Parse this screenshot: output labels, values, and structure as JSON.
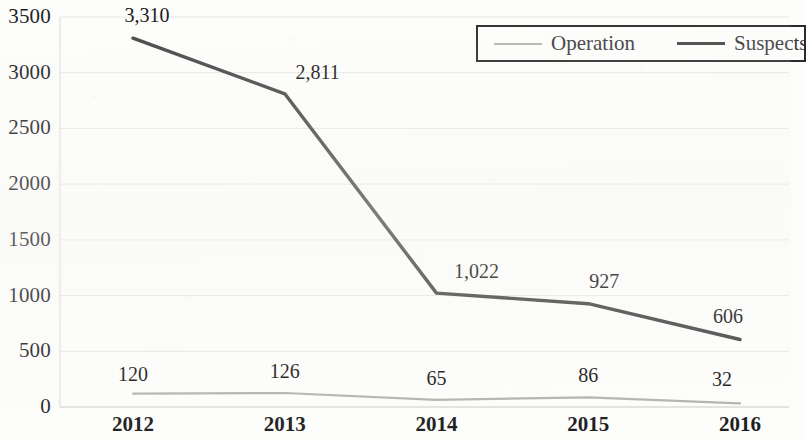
{
  "chart_data": {
    "type": "line",
    "title": "",
    "subtitle": "",
    "xlabel": "",
    "ylabel": "",
    "categories": [
      "2012",
      "2013",
      "2014",
      "2015",
      "2016"
    ],
    "ylim": [
      0,
      3500
    ],
    "yticks": [
      0,
      500,
      1000,
      1500,
      2000,
      2500,
      3000,
      3500
    ],
    "ytick_labels": [
      "0",
      "500",
      "1000",
      "1500",
      "2000",
      "2500",
      "3000",
      "3500"
    ],
    "grid": true,
    "grid_axis": "y",
    "legend_position": "top-right",
    "series": [
      {
        "name": "Operation",
        "color": "#b3b3ae",
        "values": [
          120,
          126,
          65,
          86,
          32
        ],
        "data_labels": [
          "120",
          "126",
          "65",
          "86",
          "32"
        ]
      },
      {
        "name": "Suspects",
        "color": "#454545",
        "values": [
          3310,
          2811,
          1022,
          927,
          606
        ],
        "data_labels": [
          "3,310",
          "2,811",
          "1,022",
          "927",
          "606"
        ]
      }
    ]
  },
  "legend": {
    "items": [
      {
        "label": "Operation",
        "swatch": "operation-line-swatch"
      },
      {
        "label": "Suspects",
        "swatch": "suspects-line-swatch"
      }
    ]
  },
  "colors": {
    "background": "#fdfdfc",
    "operation_line": "#b3b3ae",
    "suspects_line": "#454545",
    "gridline": "#d8d8d4",
    "axis_text": "#1b1b1b",
    "legend_border": "#2a2a2a",
    "legend_text": "#3a3a3a"
  }
}
